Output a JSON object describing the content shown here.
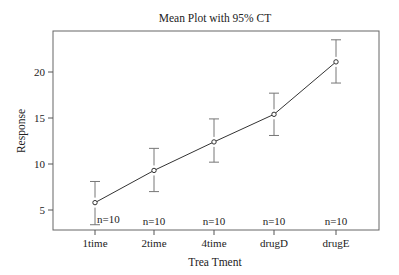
{
  "chart_data": {
    "type": "line",
    "title": "Mean Plot with 95% CT",
    "xlabel": "Trea Tment",
    "ylabel": "Response",
    "categories": [
      "1time",
      "2time",
      "4time",
      "drugD",
      "drugE"
    ],
    "series": [
      {
        "name": "Mean Response",
        "values": [
          5.8,
          9.3,
          12.4,
          15.4,
          21.1
        ],
        "ci_lower": [
          3.4,
          7.0,
          10.2,
          13.1,
          18.8
        ],
        "ci_upper": [
          8.1,
          11.7,
          14.9,
          17.7,
          23.5
        ]
      }
    ],
    "annotations": [
      "n=10",
      "n=10",
      "n=10",
      "n=10",
      "n=10"
    ],
    "yticks": [
      5,
      10,
      15,
      20
    ],
    "ylim": [
      3.2,
      24.5
    ],
    "grid": false,
    "legend": "none"
  },
  "colors": {
    "line": "#333333",
    "axis": "#555555",
    "text": "#222222",
    "background": "#ffffff"
  }
}
